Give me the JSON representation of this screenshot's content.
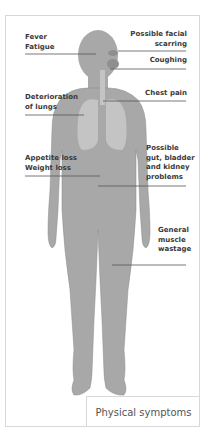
{
  "diagram": {
    "type": "human-body-symptom-map",
    "body_color": "#a8a8a8",
    "organ_color": "#c4c4c4",
    "line_color": "#555555",
    "labels": [
      {
        "id": "fever",
        "text": "Fever\nFatigue",
        "side": "left"
      },
      {
        "id": "facial",
        "text": "Possible facial\nscarring",
        "side": "right"
      },
      {
        "id": "coughing",
        "text": "Coughing",
        "side": "right"
      },
      {
        "id": "lungs",
        "text": "Deterioration\nof lungs",
        "side": "left"
      },
      {
        "id": "chest",
        "text": "Chest pain",
        "side": "right"
      },
      {
        "id": "appetite",
        "text": "Appetite loss\nWeight loss",
        "side": "left"
      },
      {
        "id": "gut",
        "text": "Possible\ngut, bladder\nand kidney\nproblems",
        "side": "right"
      },
      {
        "id": "muscle",
        "text": "General\nmuscle\nwastage",
        "side": "right"
      }
    ],
    "caption": "Physical symptoms"
  }
}
